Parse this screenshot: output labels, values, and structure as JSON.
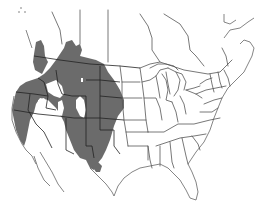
{
  "map": {
    "type": "species-range-map",
    "region": "North America (USA and southern Canada)",
    "range_color": "#6b6b6b",
    "background_color": "#ffffff",
    "border_color": "#555555",
    "range_description": "Western North America: Pacific states, Great Basin, Rocky Mountains, Great Plains west, into southern Alberta/Saskatchewan and British Columbia interior; south to Arizona, New Mexico, west Texas and northern Mexico"
  }
}
